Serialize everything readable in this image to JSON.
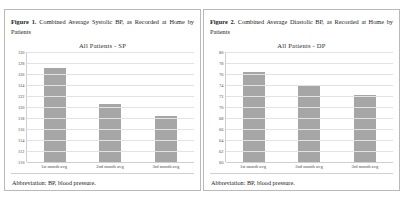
{
  "figures": [
    {
      "caption_label": "Figure 1.",
      "caption_text": "Combined Average Systolic BP, as Recorded at Home by Patients",
      "abbreviation": "Abbreviation: BP, blood pressure.",
      "chart_data": {
        "type": "bar",
        "title": "All Patients - SP",
        "categories": [
          "1st month avg",
          "2nd month avg",
          "3rd month avg"
        ],
        "values": [
          127.0,
          120.5,
          118.3
        ],
        "xlabel": "",
        "ylabel": "",
        "ylim": [
          110,
          130
        ],
        "ytick_step": 2,
        "yticks": [
          110,
          112,
          114,
          116,
          118,
          120,
          122,
          124,
          126,
          128,
          130
        ],
        "grid": true,
        "legend": "none",
        "bar_color": "#a6a6a6"
      }
    },
    {
      "caption_label": "Figure 2.",
      "caption_text": "Combined Average Diastolic BP, as Recorded at Home by Patients",
      "abbreviation": "Abbreviation: BP, blood pressure.",
      "chart_data": {
        "type": "bar",
        "title": "All Patients - DP",
        "categories": [
          "1st month avg",
          "2nd month avg",
          "3rd month avg"
        ],
        "values": [
          76.3,
          74.0,
          72.2
        ],
        "xlabel": "",
        "ylabel": "",
        "ylim": [
          60,
          80
        ],
        "ytick_step": 2,
        "yticks": [
          60,
          62,
          64,
          66,
          68,
          70,
          72,
          74,
          76,
          78,
          80
        ],
        "grid": true,
        "legend": "none",
        "bar_color": "#a6a6a6"
      }
    }
  ]
}
